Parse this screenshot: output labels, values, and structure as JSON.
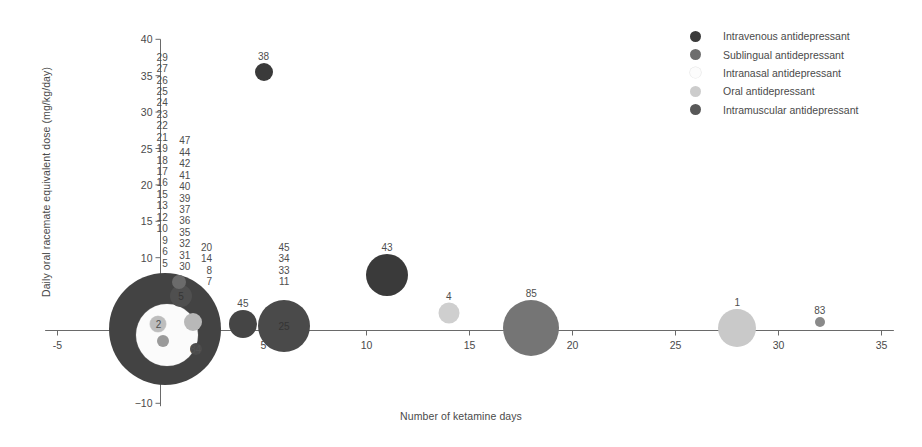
{
  "chart_data": {
    "type": "scatter",
    "title": "",
    "xlabel": "Number of ketamine days",
    "ylabel": "Daily oral racemate equivalent dose (mg/kg/day)",
    "xlim": [
      -5,
      35
    ],
    "ylim": [
      -10,
      40
    ],
    "xticks": [
      "-5",
      "5",
      "10",
      "15",
      "20",
      "25",
      "30",
      "35"
    ],
    "xtick_values": [
      -5,
      5,
      10,
      15,
      20,
      25,
      30,
      35
    ],
    "yticks": [
      "40",
      "35",
      "30",
      "25",
      "20",
      "15",
      "10",
      "-5",
      "-10"
    ],
    "ytick_values": [
      40,
      35,
      30,
      25,
      20,
      15,
      10,
      -5,
      -10
    ],
    "grid": false,
    "legend_position": "top-right",
    "size_encoding": "bubble area proportional to sample size",
    "note": "Bubble labels are study identification numbers; bubble colour encodes route of administration.",
    "series": [
      {
        "name": "Intravenous antidepressant",
        "color": "#3a3a3a"
      },
      {
        "name": "Sublingual antidepressant",
        "color": "#6e6e6e"
      },
      {
        "name": "Intranasal antidepressant",
        "color": "#fbfbfb"
      },
      {
        "name": "Oral antidepressant",
        "color": "#cfcfcf"
      },
      {
        "name": "Intramuscular antidepressant",
        "color": "#585858"
      }
    ],
    "points": [
      {
        "label": "38",
        "x": 5.0,
        "y": 35.5,
        "r": 9,
        "route": "Intravenous antidepressant",
        "color": "#3a3a3a",
        "label_pos": "above"
      },
      {
        "label": "43",
        "x": 11.0,
        "y": 7.6,
        "r": 21,
        "route": "Intravenous antidepressant",
        "color": "#3a3a3a",
        "label_pos": "above"
      },
      {
        "label": "4",
        "x": 14.0,
        "y": 2.4,
        "r": 10.5,
        "route": "Oral antidepressant",
        "color": "#cfcfcf",
        "label_pos": "above"
      },
      {
        "label": "85",
        "x": 18.0,
        "y": 0.4,
        "r": 28,
        "route": "Sublingual antidepressant",
        "color": "#757575",
        "label_pos": "above"
      },
      {
        "label": "1",
        "x": 28.0,
        "y": 0.3,
        "r": 19,
        "route": "Oral antidepressant",
        "color": "#c9c9c9",
        "label_pos": "above"
      },
      {
        "label": "83",
        "x": 32.0,
        "y": 1.1,
        "r": 5,
        "route": "Sublingual antidepressant",
        "color": "#8a8a8a",
        "label_pos": "above"
      },
      {
        "label": "25",
        "x": 6.0,
        "y": 0.6,
        "r": 26,
        "route": "Intravenous antidepressant",
        "color": "#4a4a4a",
        "label_pos": "inside"
      },
      {
        "label": "45",
        "x": 4.0,
        "y": 0.9,
        "r": 14,
        "route": "Intravenous antidepressant",
        "color": "#454545",
        "label_pos": "above"
      },
      {
        "label": "",
        "x": 0.2,
        "y": 0.2,
        "r": 56,
        "route": "Intravenous antidepressant",
        "color": "#434343",
        "label_pos": "none"
      },
      {
        "label": "",
        "x": 0.3,
        "y": -0.6,
        "r": 31,
        "route": "Intranasal antidepressant",
        "color": "#fbfbfb",
        "label_pos": "none"
      },
      {
        "label": "2",
        "x": -0.1,
        "y": 0.9,
        "r": 8,
        "route": "Intranasal antidepressant",
        "color": "#bdbdbd",
        "label_pos": "inside"
      },
      {
        "label": "5",
        "x": 1.0,
        "y": 4.8,
        "r": 11,
        "route": "Intramuscular antidepressant",
        "color": "#4f4f4f",
        "label_pos": "inside"
      },
      {
        "label": "",
        "x": 0.9,
        "y": 6.6,
        "r": 7,
        "route": "Sublingual antidepressant",
        "color": "#6b6b6b",
        "label_pos": "none"
      },
      {
        "label": "",
        "x": 1.6,
        "y": 1.2,
        "r": 9,
        "route": "Oral antidepressant",
        "color": "#b8b8b8",
        "label_pos": "none"
      },
      {
        "label": "84",
        "x": 1.7,
        "y": -2.6,
        "r": 6,
        "route": "Intravenous antidepressant",
        "color": "#4b4b4b",
        "label_pos": "inside-faint"
      },
      {
        "label": "",
        "x": 0.1,
        "y": -1.4,
        "r": 6,
        "route": "Sublingual antidepressant",
        "color": "#9a9a9a",
        "label_pos": "none"
      }
    ],
    "id_columns": [
      {
        "x": 0.35,
        "top_y": 38.3,
        "values": [
          "29",
          "27",
          "26",
          "25",
          "24",
          "23",
          "22",
          "21",
          "19",
          "18",
          "17",
          "16",
          "15",
          "13",
          "12",
          "10",
          "9",
          "6",
          "5"
        ]
      },
      {
        "x": 1.45,
        "top_y": 26.8,
        "values": [
          "47",
          "44",
          "42",
          "41",
          "40",
          "39",
          "37",
          "36",
          "35",
          "32",
          "31",
          "30"
        ]
      },
      {
        "x": 2.5,
        "top_y": 12.2,
        "values": [
          "20",
          "14",
          "8",
          "7"
        ]
      },
      {
        "x": 6.0,
        "top_y": 12.2,
        "values": [
          "45",
          "34",
          "33",
          "11"
        ]
      }
    ]
  },
  "legend": {
    "items": [
      {
        "label": "Intravenous antidepressant",
        "color": "#3a3a3a"
      },
      {
        "label": "Sublingual antidepressant",
        "color": "#6e6e6e"
      },
      {
        "label": "Intranasal antidepressant",
        "color": "#fcfcfc"
      },
      {
        "label": "Oral antidepressant",
        "color": "#cccccc"
      },
      {
        "label": "Intramuscular antidepressant",
        "color": "#585858"
      }
    ]
  }
}
